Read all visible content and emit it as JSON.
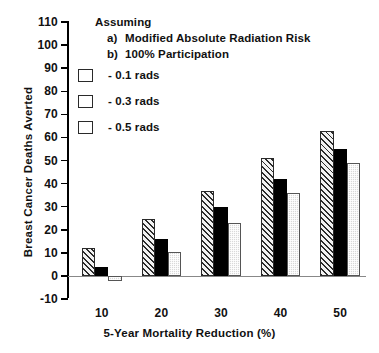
{
  "chart_data": {
    "type": "bar",
    "title": "",
    "xlabel": "5-Year Mortality Reduction (%)",
    "ylabel": "Breast Cancer Deaths Averted",
    "categories": [
      "10",
      "20",
      "30",
      "40",
      "50"
    ],
    "ylim": [
      -10,
      110
    ],
    "ytick_step": 10,
    "yticks": [
      "110",
      "100",
      "90",
      "80",
      "70",
      "60",
      "50",
      "40",
      "30",
      "20",
      "10",
      "0",
      "-10"
    ],
    "grid": false,
    "legend_position": "upper-left",
    "series": [
      {
        "name": "- 0.1 rads",
        "pattern": "diagonal-hatch",
        "color": "#f2f2f2",
        "values": [
          12,
          24.5,
          37,
          51,
          63
        ]
      },
      {
        "name": "- 0.3 rads",
        "pattern": "solid-black",
        "color": "#000000",
        "values": [
          4,
          16,
          30,
          42,
          55
        ]
      },
      {
        "name": "- 0.5 rads",
        "pattern": "light-dotted",
        "color": "#d9d9d9",
        "values": [
          -2,
          10.5,
          23,
          36,
          49
        ]
      }
    ],
    "annotations": {
      "heading": "Assuming",
      "items": [
        {
          "marker": "a)",
          "text": "Modified Absolute Radiation Risk"
        },
        {
          "marker": "b)",
          "text": "100% Participation"
        }
      ]
    }
  }
}
